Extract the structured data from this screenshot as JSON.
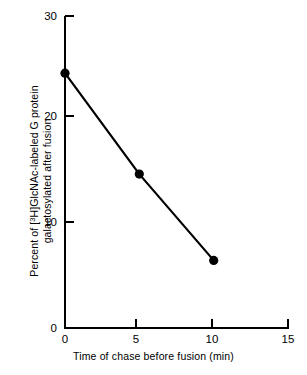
{
  "chart_data": {
    "type": "line",
    "title": "",
    "subtitle": "",
    "xlabel": "Time of chase before fusion (min)",
    "ylabel_line1_pre": "Percent of [",
    "ylabel_line1_sup": "3",
    "ylabel_line1_post": "H]GlcNAc-labeled G protein",
    "ylabel_line2": "galactosylated after fusion",
    "ylabel_plain": "Percent of [3H]GlcNAc-labeled G protein galactosylated after fusion",
    "x": [
      0,
      5,
      10
    ],
    "values": [
      24.5,
      14.8,
      6.5
    ],
    "series": [
      {
        "name": "[3H]GlcNAc-labeled G protein galactosylated after fusion",
        "x": [
          0,
          5,
          10
        ],
        "values": [
          24.5,
          14.8,
          6.5
        ],
        "marker": "filled-circle",
        "color": "#000000"
      }
    ],
    "xlim": [
      0,
      15
    ],
    "ylim": [
      0,
      30
    ],
    "xticks": [
      0,
      5,
      10,
      15
    ],
    "xtick_labels": [
      "0",
      "5",
      "10",
      "15"
    ],
    "yticks": [
      0,
      10,
      20,
      30
    ],
    "ytick_labels": [
      "0",
      "10",
      "20",
      "30"
    ],
    "grid": false,
    "legend": "none",
    "line_color": "#000000",
    "marker_color": "#000000",
    "axis_color": "#000000",
    "background_color": "#ffffff"
  },
  "axis_titles": {
    "x": "Time of chase before fusion (min)",
    "y_line1_pre": "Percent of [",
    "y_line1_sup": "3",
    "y_line1_post": "H]GlcNAc-labeled G protein",
    "y_line2": "galactosylated after fusion"
  },
  "ytick_labels": {
    "t30": "30",
    "t20": "20",
    "t10": "10",
    "t0": "0"
  },
  "xtick_labels": {
    "t0": "0",
    "t5": "5",
    "t10": "10",
    "t15": "15"
  }
}
